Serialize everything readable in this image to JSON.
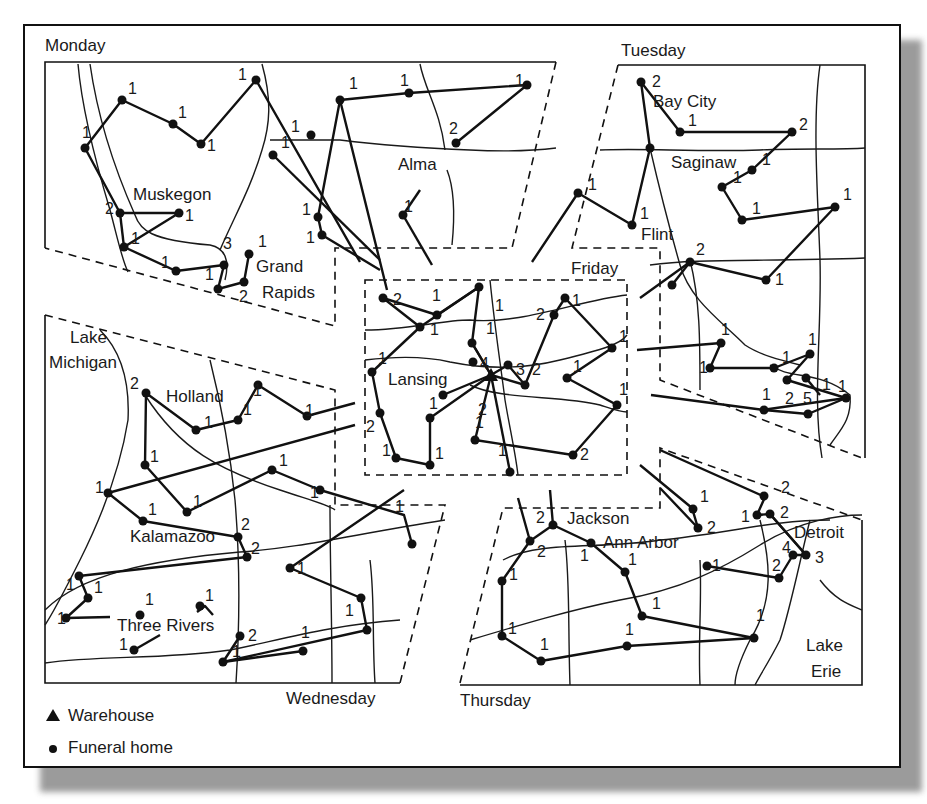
{
  "map": {
    "zones": [
      {
        "day": "Monday"
      },
      {
        "day": "Tuesday"
      },
      {
        "day": "Wednesday"
      },
      {
        "day": "Thursday"
      },
      {
        "day": "Friday"
      }
    ],
    "cities": [
      "Muskegon",
      "Grand",
      "Rapids",
      "Alma",
      "Bay City",
      "Saginaw",
      "Flint",
      "Lansing",
      "Lake",
      "Michigan",
      "Holland",
      "Kalamazoo",
      "Three Rivers",
      "Jackson",
      "Ann Arbor",
      "Detroit",
      "Lake",
      "Erie"
    ],
    "warehouse_city": "Lansing"
  },
  "legend": {
    "items": [
      {
        "symbol": "triangle",
        "label": "Warehouse"
      },
      {
        "symbol": "dot",
        "label": "Funeral home"
      }
    ]
  },
  "labels": {
    "monday": "Monday",
    "tuesday": "Tuesday",
    "wednesday": "Wednesday",
    "thursday": "Thursday",
    "friday": "Friday",
    "muskegon": "Muskegon",
    "grand": "Grand",
    "rapids": "Rapids",
    "alma": "Alma",
    "bay_city": "Bay City",
    "saginaw": "Saginaw",
    "flint": "Flint",
    "lansing": "Lansing",
    "lake1": "Lake",
    "michigan": "Michigan",
    "holland": "Holland",
    "kalamazoo": "Kalamazoo",
    "three_rivers": "Three Rivers",
    "jackson": "Jackson",
    "ann_arbor": "Ann Arbor",
    "detroit": "Detroit",
    "lake2": "Lake",
    "erie": "Erie"
  }
}
